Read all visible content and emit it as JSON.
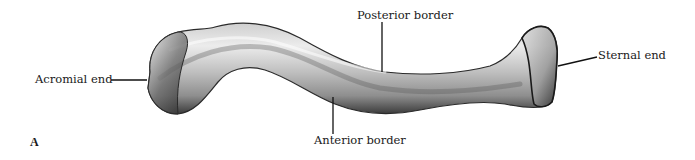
{
  "figure": {
    "panel_letter": "A",
    "labels": {
      "acromial_end": "Acromial end",
      "posterior_border": "Posterior border",
      "anterior_border": "Anterior border",
      "sternal_end": "Sternal end"
    },
    "colors": {
      "background": "#ffffff",
      "bone_light": "#e6e6e6",
      "bone_mid": "#a9a9a9",
      "bone_dark": "#2a2a2a",
      "leader_line": "#111111",
      "text": "#1a1a1a"
    }
  }
}
